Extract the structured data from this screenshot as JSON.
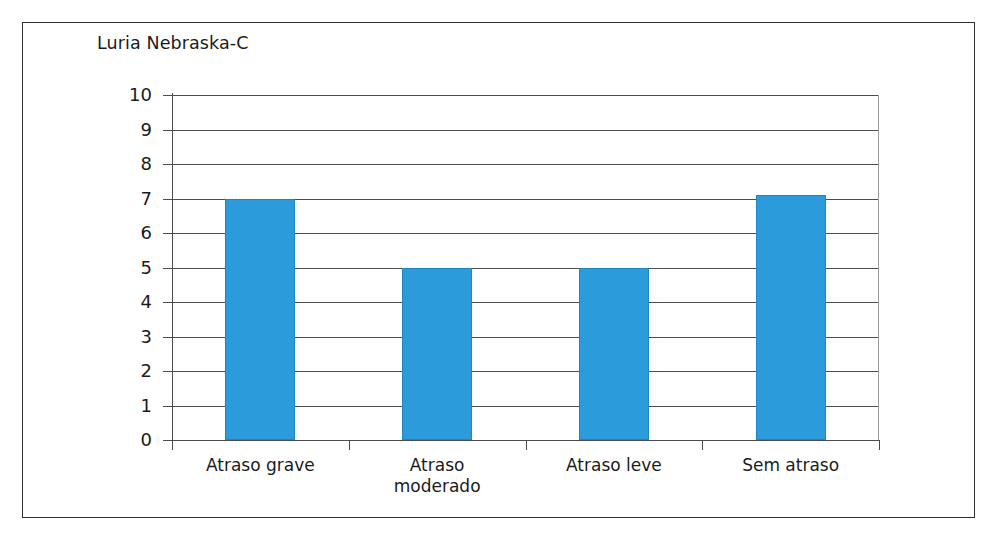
{
  "chart_data": {
    "type": "bar",
    "title": "Luria Nebraska-C",
    "xlabel": "",
    "ylabel": "",
    "categories": [
      "Atraso grave",
      "Atraso moderado",
      "Atraso leve",
      "Sem atraso"
    ],
    "category_lines": [
      [
        "Atraso grave"
      ],
      [
        "Atraso",
        "moderado"
      ],
      [
        "Atraso leve"
      ],
      [
        "Sem atraso"
      ]
    ],
    "values": [
      7,
      5,
      5,
      7.1
    ],
    "ylim": [
      0,
      10
    ],
    "ytick_step": 1,
    "yticks": [
      "10",
      "9",
      "8",
      "7",
      "6",
      "5",
      "4",
      "3",
      "2",
      "1",
      "0"
    ],
    "grid": true,
    "legend": false,
    "bar_color": "#2b9bdc",
    "bar_edge_color": "#1f86c2",
    "gridline_color": "#4d4d4d",
    "axis_color": "#4a4a4a"
  },
  "frame": {
    "border_color": "#2e2e2e"
  },
  "bottom_strip": {
    "text": ""
  }
}
